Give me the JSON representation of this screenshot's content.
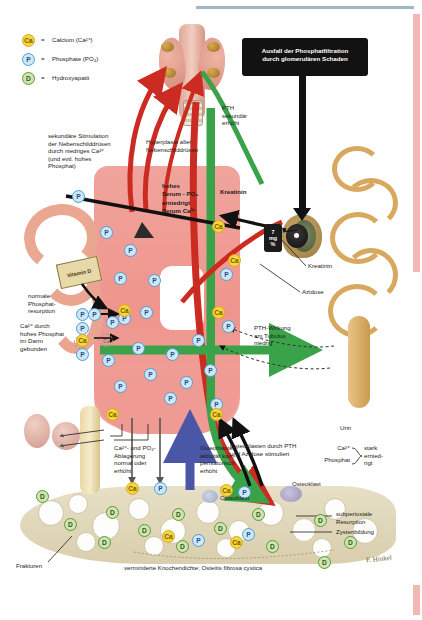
{
  "figure": {
    "legend": {
      "items": [
        {
          "symbol": "Ca",
          "type": "calcium",
          "eq": "=",
          "label": "Calcium (Ca²⁺)",
          "color": "#f4d73a"
        },
        {
          "symbol": "P",
          "type": "phosphate",
          "eq": "=",
          "label": "Phosphate (PO₄)",
          "color": "#cfe6f6"
        },
        {
          "symbol": "D",
          "type": "hydroxyapatite",
          "eq": "=",
          "label": "Hydroxyapatit",
          "color": "#cfe3b4"
        }
      ]
    },
    "labels": {
      "glomerular_failure": "Ausfall der Phosphatfiltration\ndurch glomerulären Schaden",
      "secondary_stimulation": "sekundäre Stimulation\nder Nebenschilddrüsen\ndurch niedriges Ca²⁺\n(und evtl. hohes\nPhosphat)",
      "hyperplasia": "Hyperplasie aller\nNebenschilddrüsen",
      "pth_increased": "PTH\nsekundär\nerhöht",
      "serum_status": "hohes\nSerum - PO₄\nerniedrigt\nSerum Ca²⁺",
      "creatinine_box": "Kreatinin",
      "creatinine_pointer": "Kreatinin",
      "acidosis": "Azidose",
      "mg_value": "7",
      "mg_unit": "mg\n%",
      "pth_tubulus": "PTH-Wirkung\nam Tubulus\nniedrig",
      "urine": "Urin",
      "urine_ca": "Ca²⁺",
      "urine_p": "Phosphat",
      "urine_state": "stark\nernied-\nrigt",
      "vitamin_d": "Vitamin\nD",
      "normal_resorption": "normale\nPhosphat-\nresorption",
      "ca_bound": "Ca²⁺ durch\nhohes Phosphat\nim Darm\ngebunden",
      "deposition": "Ca²⁺- und PO₄-\nAblagerung\nnormal oder\nerhöht",
      "osteoblast_activity": "Osteoblasten-\naktivität kom-\npensatorisch\nerhöht",
      "osteoclast_stimulated": "Osteoklasten durch PTH\nund Azidose stimuliert",
      "osteoblast": "Osteoblast",
      "osteoclast": "Osteoklast",
      "subperiosteal": "subperiostale\nResorption",
      "cysts": "Zystenbildung",
      "fractures": "Frakturen",
      "caption": "verminderte Knochendichte; Osteitis fibrosa cystica",
      "signature": "F. Hinkel"
    },
    "colors": {
      "blood": "#ef9a93",
      "pth_green": "#3aa349",
      "red_arrow": "#cc2b22",
      "black": "#121212",
      "calcium": "#f4d73a",
      "phosphate": "#cfe6f6",
      "hydroxyapatite": "#cfe3b4",
      "bone": "#ded3b2",
      "kidney": "#d9a85f",
      "blue_arrow": "#4a56a6",
      "page_rule": "#9fb8c9",
      "edge_rule": "#f2b9b4"
    },
    "molecules": {
      "blood_phosphate_count": 22,
      "blood_calcium_count": 4,
      "bone_hydroxyapatite_count": 12
    }
  }
}
